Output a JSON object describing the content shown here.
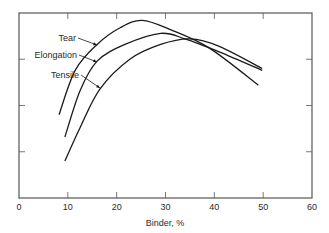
{
  "chart_data": {
    "type": "line",
    "title": "",
    "xlabel": "Binder, %",
    "ylabel": "",
    "xlim": [
      0,
      60
    ],
    "ylim": [
      0,
      100
    ],
    "x_ticks": [
      0,
      10,
      20,
      30,
      40,
      50,
      60
    ],
    "x_tick_labels": [
      "0",
      "10",
      "20",
      "30",
      "40",
      "50",
      "60"
    ],
    "y_ticks": [
      25,
      50,
      75
    ],
    "y_tick_labels": [
      "",
      "",
      ""
    ],
    "grid": false,
    "legend": "inline arrow labels",
    "series": [
      {
        "name": "Tear",
        "x": [
          8.2,
          11.5,
          16,
          20.7,
          25.2,
          31,
          39,
          49
        ],
        "y": [
          45,
          69,
          83,
          92,
          96,
          91,
          81,
          61
        ]
      },
      {
        "name": "Elongation",
        "x": [
          9.4,
          12.5,
          16,
          21.7,
          29,
          34,
          41,
          49.8
        ],
        "y": [
          33,
          58,
          74,
          83,
          89,
          86,
          79,
          69
        ]
      },
      {
        "name": "Tensile",
        "x": [
          9.4,
          12.5,
          16.6,
          22.7,
          29,
          35,
          41,
          49.8
        ],
        "y": [
          20,
          38,
          59,
          75,
          83,
          86,
          82,
          70
        ]
      }
    ],
    "annotations": [
      {
        "text": "Tear",
        "target_series": "Tear"
      },
      {
        "text": "Elongation",
        "target_series": "Elongation"
      },
      {
        "text": "Tensile",
        "target_series": "Tensile"
      }
    ]
  },
  "style": {
    "line_color": "#1a1a1a",
    "axis_color": "#555555",
    "text_color": "#2a2a2a"
  }
}
